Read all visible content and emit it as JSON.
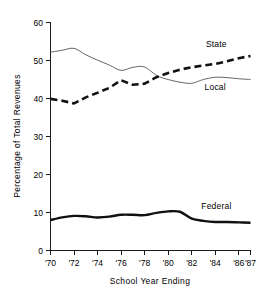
{
  "chart_data": {
    "type": "line",
    "title": "",
    "xlabel": "School Year Ending",
    "ylabel": "Percentage of Total Revenues",
    "xlim": [
      1970,
      1987
    ],
    "ylim": [
      0,
      60
    ],
    "ytick_values": [
      0,
      10,
      20,
      30,
      40,
      50,
      60
    ],
    "ytick_labels": [
      "0",
      "10",
      "20",
      "30",
      "40",
      "50",
      "60"
    ],
    "xtick_values": [
      1970,
      1972,
      1974,
      1976,
      1978,
      1980,
      1982,
      1984,
      1986,
      1987
    ],
    "xtick_labels": [
      "'70",
      "'72",
      "'74",
      "'76",
      "'78",
      "'80",
      "'82",
      "'84",
      "'86",
      "'87"
    ],
    "grid": false,
    "legend_position": "inline-labels",
    "x": [
      1970,
      1971,
      1972,
      1973,
      1974,
      1975,
      1976,
      1977,
      1978,
      1979,
      1980,
      1981,
      1982,
      1983,
      1984,
      1985,
      1986,
      1987
    ],
    "series": [
      {
        "name": "Local",
        "style": "thin-solid",
        "color": "#555555",
        "values": [
          52.2,
          52.7,
          53.2,
          51.5,
          50.1,
          48.8,
          47.4,
          48.2,
          48.3,
          46.1,
          45.0,
          44.3,
          44.0,
          45.0,
          45.6,
          45.5,
          45.2,
          45.0
        ]
      },
      {
        "name": "State",
        "style": "thick-dashed",
        "color": "#111111",
        "values": [
          39.9,
          39.4,
          38.7,
          40.3,
          41.5,
          42.8,
          44.8,
          43.6,
          43.9,
          45.6,
          46.7,
          47.6,
          48.2,
          48.7,
          49.1,
          49.8,
          50.6,
          51.2
        ]
      },
      {
        "name": "Federal",
        "style": "thick-solid",
        "color": "#111111",
        "values": [
          8.0,
          8.7,
          9.1,
          9.0,
          8.7,
          8.9,
          9.4,
          9.4,
          9.3,
          9.9,
          10.3,
          10.2,
          8.4,
          7.8,
          7.5,
          7.5,
          7.4,
          7.3
        ]
      }
    ],
    "annotations": [
      {
        "text": "State",
        "x": 1984.1,
        "y": 53.6
      },
      {
        "text": "Local",
        "x": 1984.0,
        "y": 42.3
      },
      {
        "text": "Federal",
        "x": 1984.1,
        "y": 11.0
      }
    ]
  }
}
